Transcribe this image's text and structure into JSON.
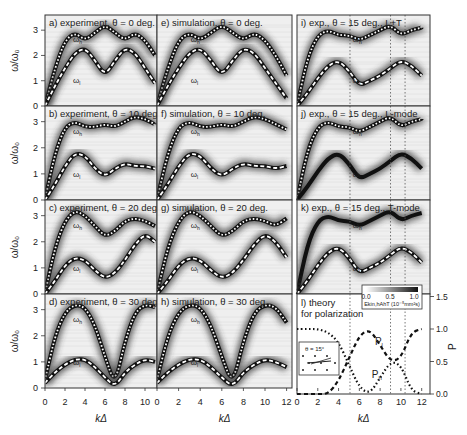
{
  "figure": {
    "ylabel_left": "ω/ω₀",
    "ylabel_right": "P",
    "xlabel": "kΔ",
    "panels": [
      {
        "id": "a",
        "label": "a) experiment, θ = 0 deg.",
        "col": 0,
        "row": 0,
        "wh": "ωh",
        "wl": "ωl"
      },
      {
        "id": "e",
        "label": "e) simulation, θ = 0 deg.",
        "col": 1,
        "row": 0,
        "wh": "ωh",
        "wl": "ωl"
      },
      {
        "id": "i",
        "label": "i) exp., θ = 15 deg., L+T",
        "col": 2,
        "row": 0,
        "wh": "ωh",
        "wl": "ωl"
      },
      {
        "id": "b",
        "label": "b) experiment, θ = 10 deg.",
        "col": 0,
        "row": 1,
        "wh": "ωh",
        "wl": "ωl"
      },
      {
        "id": "f",
        "label": "f) simulation, θ = 10 deg.",
        "col": 1,
        "row": 1,
        "wh": "ωh",
        "wl": "ωl"
      },
      {
        "id": "j",
        "label": "j) exp., θ = 15 deg., L-mode",
        "col": 2,
        "row": 1,
        "wh": "ωh",
        "wl": "ωl"
      },
      {
        "id": "c",
        "label": "c) experiment, θ = 20 deg.",
        "col": 0,
        "row": 2,
        "wh": "ωh",
        "wl": "ωl"
      },
      {
        "id": "g",
        "label": "g) simulation, θ = 20 deg.",
        "col": 1,
        "row": 2,
        "wh": "ωh",
        "wl": "ωl"
      },
      {
        "id": "k",
        "label": "k) exp., θ = 15 deg., T-mode",
        "col": 2,
        "row": 2,
        "wh": "ωh",
        "wl": "ωl"
      },
      {
        "id": "d",
        "label": "d) experiment, θ = 30 deg.",
        "col": 0,
        "row": 3,
        "wh": "ωh",
        "wl": "ωl"
      },
      {
        "id": "h",
        "label": "h) simulation, θ = 30 deg.",
        "col": 1,
        "row": 3,
        "wh": "ωh",
        "wl": "ωl"
      }
    ],
    "theory_panel": {
      "label_line1": "l) theory",
      "label_line2": "for polarization",
      "pl": "Pl",
      "ph": "Ph",
      "inset_label": "θ = 15°",
      "colorbar": {
        "ticks": [
          "0.0",
          "0.5",
          "1.0"
        ],
        "label": "Ekin,hAhT (10⁻⁵mm²s)"
      },
      "right_ticks": [
        "0.0",
        "0.5",
        "1.0",
        "1.5"
      ]
    },
    "y_ticks": [
      "0",
      "1",
      "2",
      "3"
    ],
    "x_ticks_left": [
      "0",
      "2",
      "4",
      "6",
      "8",
      "10"
    ],
    "x_ticks_mid": [
      "0",
      "2",
      "4",
      "6",
      "8",
      "10",
      "12"
    ],
    "x_ticks_right": [
      "0",
      "2",
      "4",
      "6",
      "8",
      "10",
      "12"
    ],
    "dashed_lines_k": [
      5.1,
      9.0,
      10.4
    ]
  },
  "chart_data": {
    "type": "line",
    "xlabel": "kΔ",
    "ylabel": "ω/ω0",
    "ylabel_right_panel_l": "P",
    "xlim": [
      0,
      12.5
    ],
    "ylim": [
      0,
      3.6
    ],
    "series": [
      {
        "name": "θ=0 ωh",
        "x": [
          0,
          1,
          2,
          3,
          4,
          5,
          6,
          7,
          8,
          9,
          10,
          11,
          12
        ],
        "values": [
          0,
          1.5,
          2.6,
          2.9,
          2.6,
          2.9,
          3.2,
          2.9,
          2.6,
          2.9,
          2.6,
          2.0,
          1.2
        ]
      },
      {
        "name": "θ=0 ωl",
        "x": [
          0,
          1,
          2,
          3,
          4,
          5,
          6,
          7,
          8,
          9,
          10,
          11,
          12
        ],
        "values": [
          0,
          0.8,
          1.5,
          2.1,
          2.3,
          1.8,
          1.2,
          1.8,
          2.3,
          2.1,
          1.5,
          0.9,
          0.3
        ]
      },
      {
        "name": "θ=10 ωh",
        "x": [
          0,
          1,
          2,
          3,
          4,
          5,
          6,
          7,
          8,
          9,
          10,
          11,
          12
        ],
        "values": [
          0,
          1.8,
          2.8,
          3.0,
          2.8,
          2.8,
          2.9,
          2.8,
          3.0,
          3.2,
          3.1,
          2.9,
          2.7
        ]
      },
      {
        "name": "θ=10 ωl",
        "x": [
          0,
          1,
          2,
          3,
          4,
          5,
          6,
          7,
          8,
          9,
          10,
          11,
          12
        ],
        "values": [
          0,
          0.6,
          1.3,
          1.8,
          1.7,
          1.2,
          0.9,
          1.2,
          1.4,
          1.3,
          1.3,
          1.2,
          1.3
        ]
      },
      {
        "name": "θ=20 ωh",
        "x": [
          0,
          1,
          2,
          3,
          4,
          5,
          6,
          7,
          8,
          9,
          10,
          11,
          12
        ],
        "values": [
          0,
          1.8,
          2.8,
          3.2,
          3.0,
          2.6,
          2.2,
          2.4,
          2.8,
          2.9,
          2.8,
          2.6,
          2.9
        ]
      },
      {
        "name": "θ=20 ωl",
        "x": [
          0,
          1,
          2,
          3,
          4,
          5,
          6,
          7,
          8,
          9,
          10,
          11,
          12
        ],
        "values": [
          0,
          0.5,
          1.1,
          1.4,
          1.3,
          0.9,
          0.6,
          0.8,
          1.3,
          1.9,
          2.3,
          2.0,
          1.4
        ]
      },
      {
        "name": "θ=30 ωh",
        "x": [
          0,
          1,
          2,
          3,
          4,
          5,
          6,
          7,
          8,
          9,
          10,
          11,
          12
        ],
        "values": [
          0.3,
          2.0,
          2.9,
          3.2,
          3.1,
          2.4,
          1.2,
          0.1,
          1.8,
          2.9,
          3.2,
          3.1,
          2.5
        ]
      },
      {
        "name": "θ=30 ωl",
        "x": [
          0,
          1,
          2,
          3,
          4,
          5,
          6,
          7,
          8,
          9,
          10,
          11,
          12
        ],
        "values": [
          0.2,
          0.6,
          0.9,
          1.1,
          1.1,
          0.8,
          0.4,
          0.05,
          0.6,
          0.9,
          1.1,
          1.0,
          0.8
        ]
      },
      {
        "name": "θ=15 ωh (L+T)",
        "x": [
          0,
          1,
          2,
          3,
          4,
          5,
          6,
          7,
          8,
          9,
          10,
          11,
          12
        ],
        "values": [
          0,
          1.9,
          2.8,
          3.0,
          2.8,
          2.8,
          2.6,
          2.8,
          3.0,
          3.2,
          2.8,
          3.0,
          3.1
        ]
      },
      {
        "name": "θ=15 ωl (L+T)",
        "x": [
          0,
          1,
          2,
          3,
          4,
          5,
          6,
          7,
          8,
          9,
          10,
          11,
          12
        ],
        "values": [
          0,
          0.5,
          1.1,
          1.6,
          1.8,
          1.4,
          0.8,
          1.0,
          1.2,
          1.5,
          1.8,
          1.6,
          1.2
        ]
      },
      {
        "name": "Pl (theory)",
        "x": [
          0,
          1,
          2,
          3,
          4,
          5,
          6,
          7,
          8,
          9,
          10,
          11,
          12
        ],
        "values": [
          0,
          0,
          0,
          0,
          0.2,
          0.55,
          0.9,
          1.0,
          0.75,
          0.5,
          0.55,
          0.95,
          1.0
        ]
      },
      {
        "name": "Ph (theory)",
        "x": [
          0,
          1,
          2,
          3,
          4,
          5,
          6,
          7,
          8,
          9,
          10,
          11,
          12
        ],
        "values": [
          1.0,
          1.0,
          1.0,
          0.95,
          0.8,
          0.45,
          0.1,
          0,
          0.25,
          0.5,
          0.45,
          0.05,
          0
        ]
      }
    ],
    "legend": [
      "ωh",
      "ωl",
      "Pl",
      "Ph"
    ],
    "annotations": [
      "a) experiment, θ = 0 deg.",
      "e) simulation, θ = 0 deg.",
      "i) exp., θ = 15 deg., L+T",
      "b) experiment, θ = 10 deg.",
      "f) simulation, θ = 10 deg.",
      "j) exp., θ = 15 deg., L-mode",
      "c) experiment, θ = 20 deg.",
      "g) simulation, θ = 20 deg.",
      "k) exp., θ = 15 deg., T-mode",
      "d) experiment, θ = 30 deg.",
      "h) simulation, θ = 30 deg.",
      "l) theory for polarization"
    ],
    "grid": false
  }
}
